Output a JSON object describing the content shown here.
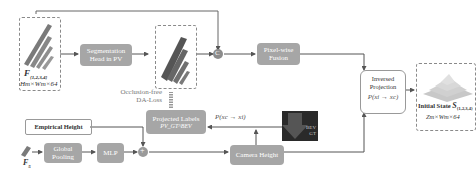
{
  "diagram": {
    "inputs": {
      "multi_scale_features": {
        "symbol": "F",
        "subscript": "{1,2,3,4}",
        "dims": "Hm×Wm×64"
      },
      "small_feature": {
        "symbol": "F",
        "subscript": "5"
      }
    },
    "boxes": {
      "segmentation_head": "Segmentation Head in PV",
      "pixel_fusion": "Pixel-wise Fusion",
      "inversed_projection_title": "Inversed Projection",
      "inversed_projection_formula": "P(xi → xc)",
      "projected_labels": "Projected Labels",
      "projected_labels_sub": "PV_GT^BEV",
      "camera_height": "Camera Height",
      "global_pooling": "Global Pooling",
      "mlp": "MLP",
      "empirical_height": "Empirical Height",
      "bev_gt_label1": "BEV",
      "bev_gt_label2": "GT"
    },
    "annotations": {
      "loss_line1": "Occlusion-free",
      "loss_line2": "DA-Loss",
      "forward_projection": "P(xc → xi)",
      "concat_symbol": "C",
      "add_symbol": "+"
    },
    "output": {
      "label": "Initial State",
      "symbol": "S",
      "subscript": "{1,2,3,4}",
      "dims": "Zm×Wm×64"
    },
    "colors": {
      "box_fill": "#a6a6a6",
      "arrow": "#555555",
      "dashed_border": "#8a8a8a",
      "bev_dark": "#2a2a2a"
    }
  }
}
